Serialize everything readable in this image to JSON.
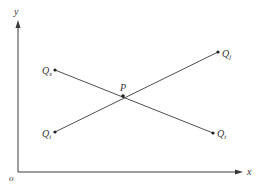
{
  "diagram": {
    "type": "coordinate-line-intersection",
    "colors": {
      "background": "#ffffff",
      "line": "#3a3a3a",
      "text": "#333333"
    },
    "axes": {
      "origin_label": "o",
      "x_label": "x",
      "y_label": "y"
    },
    "points": {
      "Qs": {
        "label": "Q",
        "sub": "s"
      },
      "Qj": {
        "label": "Q",
        "sub": "j"
      },
      "Qi": {
        "label": "Q",
        "sub": "i"
      },
      "Qt": {
        "label": "Q",
        "sub": "t"
      },
      "P": {
        "label": "P"
      }
    },
    "segments": [
      {
        "from": "Qs",
        "to": "Qt",
        "through": "P"
      },
      {
        "from": "Qi",
        "to": "Qj",
        "through": "P"
      }
    ]
  }
}
